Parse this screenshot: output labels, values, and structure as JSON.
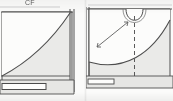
{
  "document": {
    "title": "Sewing pattern draft - two pattern pieces",
    "media": "scanned line drawing on paper",
    "paper_color": "#fbfbfa",
    "ink_color": "#4a4a4a",
    "fill_color": "#e9e9e7"
  },
  "panels": [
    {
      "id": "panel-left",
      "name": "left pattern piece",
      "labels": {
        "center_front": "CF"
      },
      "features": [
        "top straight edge",
        "concave curved cut line sweeping from upper right to lower left",
        "double vertical line at right edge",
        "horizontal rectangular slot near bottom"
      ]
    },
    {
      "id": "panel-right",
      "name": "right pattern piece",
      "labels": {
        "center_front": "CF",
        "grainline": "GRAIN"
      },
      "features": [
        "top straight edge",
        "U-shaped neckline notch at top centre",
        "large concave curve across lower half",
        "vertical dashed centre-front fold line",
        "diagonal double-arrow grainline marker",
        "horizontal rectangular slot near bottom"
      ]
    }
  ],
  "annotations": {
    "cf_meaning": "CF",
    "grain_marker": "GRAIN"
  }
}
